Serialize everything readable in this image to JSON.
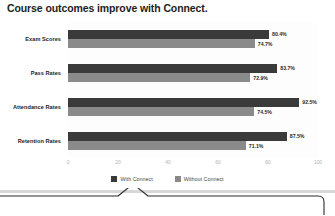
{
  "chart_data": {
    "type": "bar",
    "orientation": "horizontal",
    "title": "Course outcomes improve with Connect.",
    "xlabel": "",
    "ylabel": "",
    "xlim": [
      0,
      100
    ],
    "xticks": [
      0,
      20,
      40,
      60,
      80,
      100
    ],
    "xtick_labels": [
      "0",
      "20",
      "40",
      "60",
      "80",
      "100"
    ],
    "grid": false,
    "legend_position": "bottom-center",
    "categories": [
      "Exam Scores",
      "Pass Rates",
      "Attendance Rates",
      "Retention Rates"
    ],
    "series": [
      {
        "name": "With Connect",
        "color": "#3a3a3a",
        "values": [
          80.4,
          83.7,
          92.5,
          87.5
        ],
        "labels": [
          "80.4%",
          "83.7%",
          "92.5%",
          "87.5%"
        ]
      },
      {
        "name": "Without Connect",
        "color": "#8a8a8a",
        "values": [
          74.7,
          72.9,
          74.5,
          71.1
        ],
        "labels": [
          "74.7%",
          "72.9%",
          "74.5%",
          "71.1%"
        ]
      }
    ]
  },
  "colors": {
    "with_connect": "#3a3a3a",
    "without_connect": "#8a8a8a",
    "title_text": "#1d1d1d",
    "tick_text": "#b0b0b0",
    "divider": "#d8d8d8",
    "callout_stroke": "#2b2b2b"
  },
  "callout": {
    "shape": "speech-bubble-tail",
    "pointer_x": 133
  }
}
